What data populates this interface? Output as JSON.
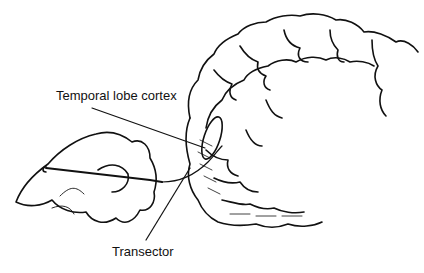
{
  "figure": {
    "type": "medical line illustration",
    "labels": {
      "cortex": "Temporal lobe cortex",
      "transector": "Transector"
    },
    "colors": {
      "line": "#111111",
      "background": "#ffffff"
    }
  }
}
